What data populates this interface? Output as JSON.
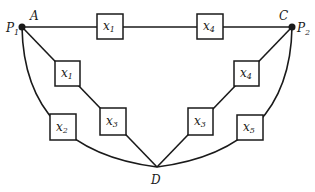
{
  "diagram": {
    "type": "reliability-network",
    "nodes": [
      {
        "id": "A",
        "label": "A",
        "alias": "P",
        "alias_sub": "1"
      },
      {
        "id": "C",
        "label": "C",
        "alias": "P",
        "alias_sub": "2"
      },
      {
        "id": "D",
        "label": "D"
      }
    ],
    "components": [
      {
        "id": "top-left",
        "var": "x",
        "sub": "1",
        "path": "A-C"
      },
      {
        "id": "top-right",
        "var": "x",
        "sub": "4",
        "path": "A-C"
      },
      {
        "id": "left-inner-upper",
        "var": "x",
        "sub": "1",
        "path": "A-D"
      },
      {
        "id": "left-inner-lower",
        "var": "x",
        "sub": "3",
        "path": "A-D"
      },
      {
        "id": "left-outer",
        "var": "x",
        "sub": "2",
        "path": "A-D"
      },
      {
        "id": "right-inner-upper",
        "var": "x",
        "sub": "4",
        "path": "C-D"
      },
      {
        "id": "right-inner-lower",
        "var": "x",
        "sub": "3",
        "path": "C-D"
      },
      {
        "id": "right-outer",
        "var": "x",
        "sub": "5",
        "path": "C-D"
      }
    ]
  }
}
